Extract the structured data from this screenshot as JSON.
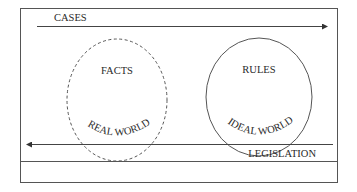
{
  "diagram": {
    "top_arrow": {
      "label": "CASES",
      "direction": "right"
    },
    "bottom_arrow": {
      "label": "LEGISLATION",
      "direction": "left"
    },
    "left_circle": {
      "title": "FACTS",
      "caption": "REAL WORLD",
      "border": "dashed"
    },
    "right_circle": {
      "title": "RULES",
      "caption": "IDEAL WORLD",
      "border": "solid"
    },
    "colors": {
      "stroke": "#4a4a4a",
      "text": "#2a2a2a",
      "background": "#ffffff"
    }
  }
}
